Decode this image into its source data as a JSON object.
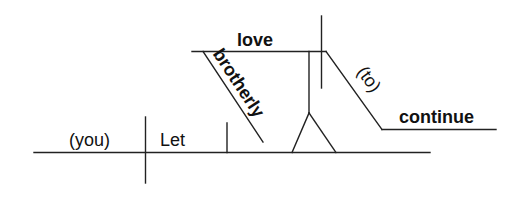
{
  "diagram": {
    "type": "sentence-diagram",
    "sentence": "Let brotherly love continue.",
    "words": {
      "subject": "(you)",
      "verb": "Let",
      "object_noun": "love",
      "object_modifier": "brotherly",
      "infinitive_marker": "(to)",
      "infinitive_verb": "continue"
    },
    "roles": {
      "subject": "understood subject",
      "verb": "main verb",
      "object_noun": "subject of infinitive phrase",
      "object_modifier": "adjective modifying love",
      "infinitive_marker": "understood infinitive marker",
      "infinitive_verb": "infinitive"
    },
    "colors": {
      "line": "#222222",
      "text": "#111111",
      "background": "#ffffff"
    }
  }
}
